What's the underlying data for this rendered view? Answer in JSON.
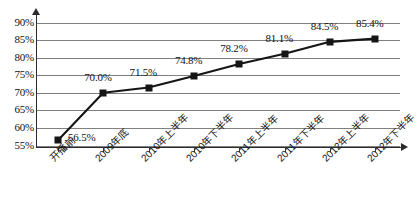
{
  "chart_data": {
    "type": "line",
    "title": "",
    "xlabel": "",
    "ylabel": "",
    "categories": [
      "开播前",
      "2009年底",
      "2010年上半年",
      "2010年下半年",
      "2011年上半年",
      "2011年下半年",
      "2012年上半年",
      "2012年下半年"
    ],
    "values": [
      56.5,
      70.0,
      71.5,
      74.8,
      78.2,
      81.1,
      84.5,
      85.4
    ],
    "data_labels": [
      "56.5%",
      "70.0%",
      "71.5%",
      "74.8%",
      "78.2%",
      "81.1%",
      "84.5%",
      "85.4%"
    ],
    "ylim": [
      55,
      90
    ],
    "ytick_values": [
      90,
      85,
      80,
      75,
      70,
      65,
      60,
      55
    ],
    "ytick_labels": [
      "90%",
      "85%",
      "80%",
      "75%",
      "70%",
      "65%",
      "60%",
      "55%"
    ],
    "grid": true,
    "legend": null,
    "series_color": "#151515",
    "grid_color": "#808080",
    "axis_color": "#2b2b2b",
    "marker": "square"
  }
}
